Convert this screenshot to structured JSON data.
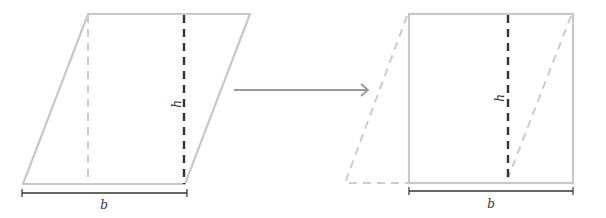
{
  "diagram": {
    "left_figure": {
      "shape": "parallelogram",
      "height_label": "h",
      "base_label": "b"
    },
    "arrow": {
      "direction": "right"
    },
    "right_figure": {
      "shape": "rectangle",
      "height_label": "h",
      "base_label": "b"
    },
    "colors": {
      "outline": "#c8c8c8",
      "height_line": "#333333",
      "base_line": "#333333",
      "arrow": "#999999"
    }
  }
}
